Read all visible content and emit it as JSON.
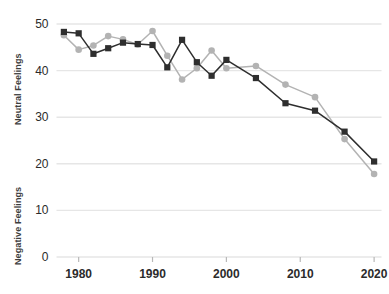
{
  "chart_data": {
    "type": "line",
    "title": "",
    "subtitle": "",
    "xlabel": "",
    "ylabel": "Neutral Feelings / Negative Feelings",
    "ylabel_upper": "Neutral Feelings",
    "ylabel_lower": "Negative Feelings",
    "xlim": [
      1977,
      2021
    ],
    "ylim": [
      0,
      50
    ],
    "xticks": [
      1980,
      1990,
      2000,
      2010,
      2020
    ],
    "xtick_labels": [
      "1980",
      "1990",
      "2000",
      "2010",
      "2020"
    ],
    "yticks": [
      0,
      10,
      20,
      30,
      40,
      50
    ],
    "ytick_labels": [
      "0",
      "10",
      "20",
      "30",
      "40",
      "50"
    ],
    "grid": true,
    "grid_axis": "y",
    "legend": false,
    "legend_position": "none",
    "x": [
      1978,
      1980,
      1982,
      1984,
      1986,
      1988,
      1990,
      1992,
      1994,
      1996,
      1998,
      2000,
      2004,
      2008,
      2012,
      2016,
      2020
    ],
    "series": [
      {
        "name": "Neutral Feelings",
        "marker": "square",
        "color": "#2e2e2e",
        "values": [
          48.3,
          48.0,
          43.6,
          44.8,
          46.0,
          45.7,
          45.5,
          40.7,
          46.6,
          41.8,
          38.9,
          42.3,
          38.4,
          33.0,
          31.4,
          26.9,
          20.5
        ]
      },
      {
        "name": "Negative Feelings",
        "marker": "circle",
        "color": "#b3b3b3",
        "values": [
          47.6,
          44.5,
          45.4,
          47.4,
          46.7,
          45.6,
          48.5,
          43.2,
          38.1,
          40.5,
          44.3,
          40.5,
          41.0,
          37.0,
          34.3,
          25.3,
          17.8
        ]
      }
    ]
  },
  "colors": {
    "series_dark": "#2e2e2e",
    "series_light": "#b3b3b3",
    "gridline": "#e6e6e6",
    "tick_text": "#2b2b2b",
    "axis_title": "#3d3d3d"
  }
}
